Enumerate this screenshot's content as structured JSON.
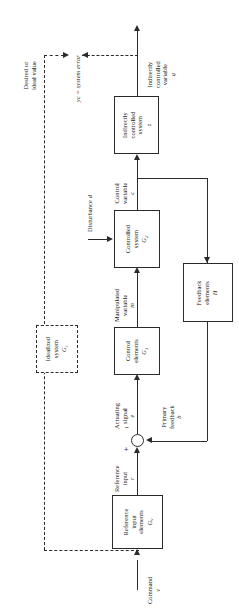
{
  "figure": {
    "type": "control-system-block-diagram",
    "orientation": "rotated-90-ccw",
    "width": 239,
    "height": 612,
    "line_color": "#2b2b2b",
    "background": "#ffffff"
  },
  "blocks": {
    "reference_input_elements": {
      "line1": "Reference",
      "line2": "input",
      "line3": "elements",
      "symbol": "G",
      "symbol_sub": "v"
    },
    "control_elements": {
      "line1": "Control",
      "line2": "elements",
      "symbol": "G",
      "symbol_sub": "1"
    },
    "controlled_system": {
      "line1": "Controlled",
      "line2": "system",
      "symbol": "G",
      "symbol_sub": "2"
    },
    "indirectly_controlled_system": {
      "line1": "Indirectly",
      "line2": "controlled",
      "line3": "system",
      "symbol": "z",
      "symbol_sub": ""
    },
    "feedback_elements": {
      "line1": "Feedback",
      "line2": "elements",
      "symbol": "H",
      "symbol_sub": ""
    },
    "idealized_system": {
      "line1": "Idealized",
      "line2": "system",
      "symbol": "G",
      "symbol_sub": "i"
    }
  },
  "signals": {
    "command": {
      "label": "Command",
      "symbol": "v"
    },
    "reference_input": {
      "line1": "Reference",
      "line2": "input",
      "symbol": "r"
    },
    "actuating_signal": {
      "line1": "Actuating",
      "line2": "signal",
      "symbol": "e"
    },
    "manipulated_variable": {
      "line1": "Manipulated",
      "line2": "variable",
      "symbol": "m"
    },
    "control_variable": {
      "line1": "Control",
      "line2": "variable",
      "symbol": "c"
    },
    "indirectly_controlled_variable": {
      "line1": "Indirectly",
      "line2": "controlled",
      "line3": "variable",
      "symbol": "q"
    },
    "primary_feedback": {
      "line1": "Primary",
      "line2": "feedback",
      "symbol": "b"
    },
    "disturbance": {
      "label": "Disturbance",
      "symbol": "d"
    },
    "desired_or_ideal_value": {
      "line1": "Desired or",
      "line2": "ideal value"
    },
    "system_error": {
      "text": "yc = system error"
    }
  },
  "summing_junction": {
    "plus": "+",
    "minus": "−"
  }
}
